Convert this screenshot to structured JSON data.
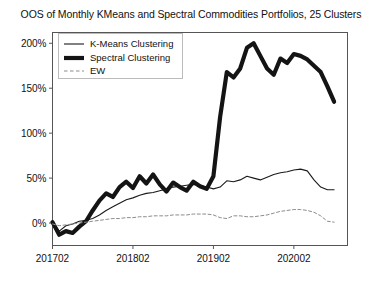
{
  "chart_data": {
    "type": "line",
    "title": "OOS of Monthly KMeans and Spectral Commodities Portfolios, 25 Clusters",
    "xlabel": "",
    "ylabel": "",
    "grid": false,
    "legend_position": "upper left",
    "xlim": [
      0,
      44
    ],
    "ylim": [
      -25,
      212
    ],
    "ytick_values": [
      0,
      50,
      100,
      150,
      200
    ],
    "ytick_labels": [
      "0%",
      "50%",
      "100%",
      "150%",
      "200%"
    ],
    "xtick_positions": [
      0,
      12,
      24,
      36
    ],
    "xtick_labels": [
      "201702",
      "201802",
      "201902",
      "202002"
    ],
    "x": [
      0,
      1,
      2,
      3,
      4,
      5,
      6,
      7,
      8,
      9,
      10,
      11,
      12,
      13,
      14,
      15,
      16,
      17,
      18,
      19,
      20,
      21,
      22,
      23,
      24,
      25,
      26,
      27,
      28,
      29,
      30,
      31,
      32,
      33,
      34,
      35,
      36,
      37,
      38,
      39,
      40,
      41,
      42
    ],
    "series": [
      {
        "name": "K-Means Clustering",
        "style": "solid-thin",
        "color": "#1a1a1a",
        "values": [
          2,
          -9,
          -3,
          -1,
          2,
          3,
          5,
          9,
          14,
          18,
          22,
          26,
          28,
          31,
          33,
          34,
          36,
          38,
          40,
          41,
          42,
          43,
          42,
          40,
          38,
          40,
          47,
          46,
          48,
          52,
          50,
          48,
          51,
          54,
          56,
          57,
          59,
          60,
          58,
          48,
          40,
          37,
          37
        ]
      },
      {
        "name": "Spectral Clustering",
        "style": "solid-thick",
        "color": "#141414",
        "values": [
          1,
          -13,
          -9,
          -11,
          -4,
          2,
          14,
          25,
          33,
          29,
          40,
          46,
          39,
          52,
          44,
          54,
          43,
          35,
          45,
          40,
          36,
          46,
          41,
          38,
          52,
          118,
          168,
          162,
          172,
          195,
          200,
          186,
          172,
          165,
          183,
          178,
          188,
          186,
          182,
          175,
          168,
          152,
          135
        ]
      },
      {
        "name": "EW",
        "style": "dashed",
        "color": "#8c8c8c",
        "values": [
          -1,
          -3,
          -2,
          -1,
          0,
          1,
          2,
          3,
          4,
          5,
          5,
          6,
          6,
          7,
          7,
          8,
          8,
          8,
          9,
          9,
          9,
          10,
          10,
          10,
          9,
          6,
          5,
          8,
          8,
          7,
          7,
          8,
          9,
          11,
          13,
          14,
          15,
          15,
          14,
          12,
          8,
          2,
          1
        ]
      }
    ]
  }
}
